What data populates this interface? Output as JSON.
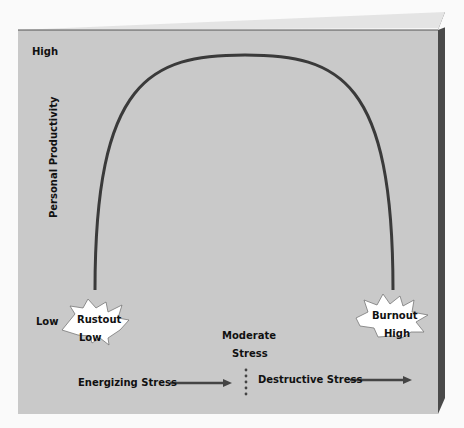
{
  "diagram": {
    "y_axis": {
      "label": "Personal Productivity",
      "high": "High",
      "low": "Low"
    },
    "x_axis": {
      "low": "Low",
      "mid_line1": "Moderate",
      "mid_line2": "Stress",
      "high": "High"
    },
    "bursts": {
      "left": "Rustout",
      "right": "Burnout"
    },
    "arrows": {
      "left": "Energizing Stress",
      "right": "Destructive Stress"
    },
    "colors": {
      "panel": "#c9c9c9",
      "panel_side": "#4a4a4a",
      "panel_top": "#e4e4e4",
      "curve": "#3a3a3a",
      "burst_fill": "#ffffff"
    }
  }
}
